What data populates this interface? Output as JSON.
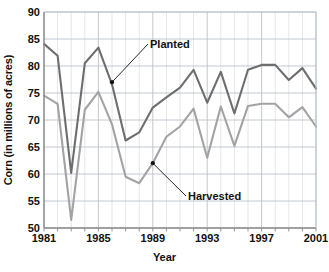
{
  "chart_data": {
    "type": "line",
    "title": "",
    "xlabel": "Year",
    "ylabel": "Corn (in millions of acres)",
    "xlim": [
      1981,
      2001
    ],
    "ylim": [
      50,
      90
    ],
    "yticks": [
      50,
      55,
      60,
      65,
      70,
      75,
      80,
      85,
      90
    ],
    "xticks": [
      1981,
      1985,
      1989,
      1993,
      1997,
      2001
    ],
    "grid": true,
    "legend": "inline-annotations",
    "x": [
      1981,
      1982,
      1983,
      1984,
      1985,
      1986,
      1987,
      1988,
      1989,
      1990,
      1991,
      1992,
      1993,
      1994,
      1995,
      1996,
      1997,
      1998,
      1999,
      2000,
      2001
    ],
    "series": [
      {
        "name": "Planted",
        "color": "#6e6e6e",
        "values": [
          84.1,
          81.9,
          60.2,
          80.5,
          83.4,
          76.6,
          66.2,
          67.7,
          72.3,
          74.2,
          76.0,
          79.3,
          73.2,
          78.9,
          71.2,
          79.3,
          80.2,
          80.2,
          77.4,
          79.6,
          75.8
        ]
      },
      {
        "name": "Harvested",
        "color": "#a3a3a3",
        "values": [
          74.5,
          73.0,
          51.5,
          71.9,
          75.2,
          69.2,
          59.5,
          58.3,
          62.0,
          66.9,
          68.8,
          72.1,
          63.0,
          72.5,
          65.2,
          72.6,
          73.0,
          73.0,
          70.5,
          72.4,
          68.8
        ]
      }
    ],
    "annotations": [
      {
        "label": "Planted",
        "point_x": 1986,
        "point_y": 77.0
      },
      {
        "label": "Harvested",
        "point_x": 1989,
        "point_y": 62.0
      }
    ]
  },
  "axes": {
    "y_tick_labels": [
      "90",
      "85",
      "80",
      "75",
      "70",
      "65",
      "60",
      "55",
      "50"
    ],
    "x_tick_labels": [
      "1981",
      "1985",
      "1989",
      "1993",
      "1997",
      "2001"
    ],
    "y_title": "Corn (in millions of acres)",
    "x_title": "Year"
  },
  "style": {
    "grid_color": "#b9bfcb",
    "axis_color": "#8a8a8a",
    "planted_color": "#6e6e6e",
    "harvested_color": "#a3a3a3",
    "text_color": "#111111",
    "background": "#ffffff"
  }
}
